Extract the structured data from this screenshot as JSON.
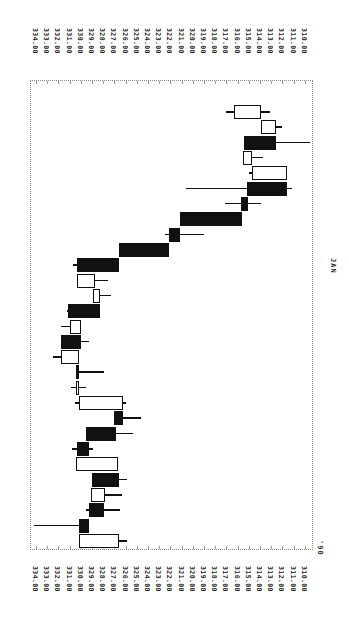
{
  "chart_data": {
    "type": "candlestick",
    "orientation": "rotated-90-clockwise",
    "title": "",
    "xlabel": "",
    "ylabel": "",
    "price_axis": {
      "ticks": [
        "334.00",
        "333.00",
        "332.00",
        "331.00",
        "330.00",
        "329.00",
        "328.00",
        "327.00",
        "326.00",
        "325.00",
        "324.00",
        "323.00",
        "322.00",
        "321.00",
        "320.00",
        "319.00",
        "318.00",
        "317.00",
        "316.00",
        "315.00",
        "314.00",
        "313.00",
        "312.00",
        "311.00",
        "310.00"
      ],
      "range": [
        310,
        334
      ]
    },
    "time_axis": {
      "labels": [
        "'90",
        "JAN"
      ]
    },
    "grid": false,
    "candles": [
      {
        "index": 1,
        "open": 326.6,
        "close": 330.2,
        "high": 330.2,
        "low": 325.9,
        "fill": "hollow"
      },
      {
        "index": 2,
        "open": 330.2,
        "close": 329.3,
        "high": 334.2,
        "low": 329.3,
        "fill": "filled"
      },
      {
        "index": 3,
        "open": 329.3,
        "close": 327.9,
        "high": 329.5,
        "low": 326.5,
        "fill": "filled"
      },
      {
        "index": 4,
        "open": 327.8,
        "close": 329.1,
        "high": 329.1,
        "low": 326.3,
        "fill": "hollow"
      },
      {
        "index": 5,
        "open": 329.0,
        "close": 326.6,
        "high": 329.0,
        "low": 325.9,
        "fill": "filled"
      },
      {
        "index": 6,
        "open": 326.7,
        "close": 330.4,
        "high": 330.4,
        "low": 326.7,
        "fill": "hollow"
      },
      {
        "index": 7,
        "open": 330.3,
        "close": 329.3,
        "high": 330.8,
        "low": 328.9,
        "fill": "filled"
      },
      {
        "index": 8,
        "open": 329.5,
        "close": 326.9,
        "high": 329.5,
        "low": 325.3,
        "fill": "filled"
      },
      {
        "index": 9,
        "open": 327.0,
        "close": 326.2,
        "high": 327.0,
        "low": 324.6,
        "fill": "filled"
      },
      {
        "index": 10,
        "open": 326.2,
        "close": 330.2,
        "high": 330.5,
        "low": 326.0,
        "fill": "hollow"
      },
      {
        "index": 11,
        "open": 330.3,
        "close": 330.4,
        "high": 330.9,
        "low": 329.5,
        "fill": "hollow"
      },
      {
        "index": 12,
        "open": 330.4,
        "close": 330.3,
        "high": 330.4,
        "low": 327.9,
        "fill": "filled"
      },
      {
        "index": 13,
        "open": 330.2,
        "close": 331.8,
        "high": 332.5,
        "low": 330.2,
        "fill": "hollow"
      },
      {
        "index": 14,
        "open": 331.8,
        "close": 330.0,
        "high": 331.8,
        "low": 329.3,
        "fill": "filled"
      },
      {
        "index": 15,
        "open": 330.0,
        "close": 331.0,
        "high": 331.8,
        "low": 330.0,
        "fill": "hollow"
      },
      {
        "index": 16,
        "open": 331.1,
        "close": 328.3,
        "high": 331.2,
        "low": 328.3,
        "fill": "filled"
      },
      {
        "index": 17,
        "open": 328.3,
        "close": 328.9,
        "high": 328.9,
        "low": 327.3,
        "fill": "hollow"
      },
      {
        "index": 18,
        "open": 328.7,
        "close": 330.3,
        "high": 330.3,
        "low": 327.6,
        "fill": "hollow"
      },
      {
        "index": 19,
        "open": 330.3,
        "close": 326.6,
        "high": 330.7,
        "low": 326.6,
        "fill": "filled"
      },
      {
        "index": 20,
        "open": 326.6,
        "close": 322.1,
        "high": 326.6,
        "low": 322.1,
        "fill": "filled"
      },
      {
        "index": 21,
        "open": 322.1,
        "close": 321.1,
        "high": 322.5,
        "low": 319.0,
        "fill": "filled"
      },
      {
        "index": 22,
        "open": 321.1,
        "close": 315.6,
        "high": 321.1,
        "low": 315.6,
        "fill": "filled"
      },
      {
        "index": 23,
        "open": 315.7,
        "close": 315.1,
        "high": 317.1,
        "low": 313.9,
        "fill": "filled"
      },
      {
        "index": 24,
        "open": 315.2,
        "close": 311.6,
        "high": 320.6,
        "low": 311.1,
        "fill": "filled"
      },
      {
        "index": 25,
        "open": 311.6,
        "close": 314.7,
        "high": 315.0,
        "low": 311.6,
        "fill": "hollow"
      },
      {
        "index": 26,
        "open": 314.7,
        "close": 315.5,
        "high": 315.5,
        "low": 313.7,
        "fill": "hollow"
      },
      {
        "index": 27,
        "open": 315.4,
        "close": 312.6,
        "high": 315.4,
        "low": 309.5,
        "fill": "filled"
      },
      {
        "index": 28,
        "open": 312.6,
        "close": 313.9,
        "high": 313.9,
        "low": 312.0,
        "fill": "hollow"
      },
      {
        "index": 29,
        "open": 313.9,
        "close": 316.3,
        "high": 317.0,
        "low": 313.1,
        "fill": "hollow"
      }
    ]
  },
  "labels": {
    "year": "'90",
    "month": "JAN"
  }
}
